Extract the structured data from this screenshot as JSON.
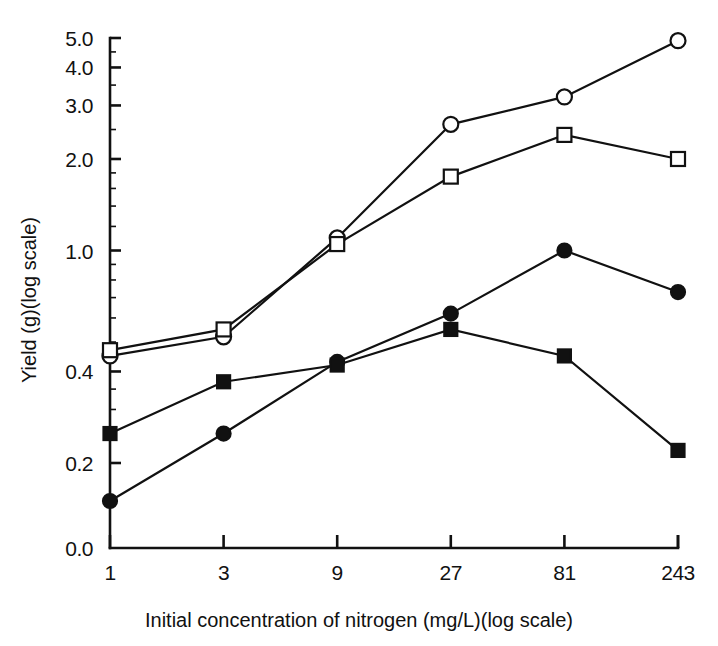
{
  "chart_data": {
    "type": "line",
    "title": "",
    "xlabel": "Initial concentration of nitrogen (mg/L)(log scale)",
    "ylabel": "Yield (g)(log scale)",
    "x_scale": "log",
    "y_scale": "log",
    "grid": false,
    "legend": "none",
    "x": [
      1,
      3,
      9,
      27,
      81,
      243
    ],
    "x_tick_labels": [
      "1",
      "3",
      "9",
      "27",
      "81",
      "243"
    ],
    "y_tick_labels": [
      "0.0",
      "0.2",
      "0.4",
      "1.0",
      "2.0",
      "3.0",
      "4.0",
      "5.0"
    ],
    "y_tick_values": [
      0.0,
      0.2,
      0.4,
      1.0,
      2.0,
      3.0,
      4.0,
      5.0
    ],
    "ylim": [
      0.0,
      5.0
    ],
    "series": [
      {
        "name": "open-circle-series",
        "marker": "open-circle",
        "values": [
          0.45,
          0.52,
          1.1,
          2.6,
          3.2,
          4.9
        ]
      },
      {
        "name": "open-square-series",
        "marker": "open-square",
        "values": [
          0.47,
          0.55,
          1.05,
          1.75,
          2.4,
          2.0
        ]
      },
      {
        "name": "filled-circle-series",
        "marker": "filled-circle",
        "values": [
          0.15,
          0.25,
          0.43,
          0.62,
          1.0,
          0.73
        ]
      },
      {
        "name": "filled-square-series",
        "marker": "filled-square",
        "values": [
          0.25,
          0.37,
          0.42,
          0.55,
          0.45,
          0.22
        ]
      }
    ]
  },
  "axes": {
    "x_title": "Initial concentration of nitrogen (mg/L)(log scale)",
    "y_title": "Yield (g)(log scale)"
  }
}
